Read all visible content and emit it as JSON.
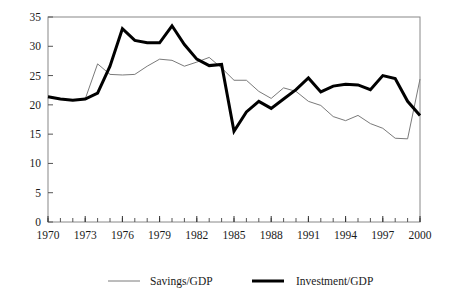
{
  "chart_data": {
    "type": "line",
    "title": "",
    "xlabel": "",
    "ylabel": "",
    "xlim": [
      1970,
      2000
    ],
    "ylim": [
      0,
      35
    ],
    "yticks": [
      0,
      5,
      10,
      15,
      20,
      25,
      30,
      35
    ],
    "ytick_labels": [
      "0",
      "5",
      "10",
      "15",
      "20",
      "25",
      "30",
      "35"
    ],
    "xticks": [
      1970,
      1973,
      1976,
      1979,
      1982,
      1985,
      1988,
      1991,
      1994,
      1997,
      2000
    ],
    "xtick_labels": [
      "1970",
      "1973",
      "1976",
      "1979",
      "1982",
      "1985",
      "1988",
      "1991",
      "1994",
      "1997",
      "2000"
    ],
    "x_minor_tick_interval": 1,
    "grid": false,
    "legend_position": "bottom",
    "x": [
      1970,
      1971,
      1972,
      1973,
      1974,
      1975,
      1976,
      1977,
      1978,
      1979,
      1980,
      1981,
      1982,
      1983,
      1984,
      1985,
      1986,
      1987,
      1988,
      1989,
      1990,
      1991,
      1992,
      1993,
      1994,
      1995,
      1996,
      1997,
      1998,
      1999,
      2000
    ],
    "series": [
      {
        "name": "Savings/GDP",
        "color": "#7a7a7a",
        "width": 1,
        "values": [
          21.5,
          21.0,
          20.8,
          21.0,
          27.0,
          25.2,
          25.1,
          25.2,
          26.6,
          27.8,
          27.6,
          26.6,
          27.3,
          28.1,
          26.3,
          24.2,
          24.2,
          22.3,
          21.1,
          22.9,
          22.3,
          20.6,
          19.9,
          18.0,
          17.3,
          18.2,
          16.8,
          16.0,
          14.3,
          14.2,
          24.4
        ]
      },
      {
        "name": "Investment/GDP",
        "color": "#000000",
        "width": 3,
        "values": [
          21.4,
          21.0,
          20.8,
          21.0,
          22.0,
          26.6,
          33.0,
          31.0,
          30.6,
          30.6,
          33.5,
          30.3,
          27.8,
          26.7,
          26.9,
          15.5,
          18.8,
          20.6,
          19.4,
          21.0,
          22.6,
          24.6,
          22.2,
          23.2,
          23.5,
          23.4,
          22.6,
          25.0,
          24.5,
          20.6,
          18.2
        ]
      }
    ]
  },
  "legend": {
    "items": [
      {
        "label": "Savings/GDP"
      },
      {
        "label": "Investment/GDP"
      }
    ]
  }
}
